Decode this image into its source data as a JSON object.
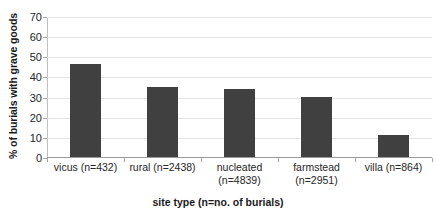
{
  "chart_data": {
    "type": "bar",
    "title": "",
    "categories": [
      "vicus (n=432)",
      "rural (n=2438)",
      "nucleated (n=4839)",
      "farmstead (n=2951)",
      "villa (n=864)"
    ],
    "category_lines": [
      [
        "vicus (n=432)"
      ],
      [
        "rural (n=2438)"
      ],
      [
        "nucleated",
        "(n=4839)"
      ],
      [
        "farmstead",
        "(n=2951)"
      ],
      [
        "villa (n=864)"
      ]
    ],
    "values": [
      46,
      35,
      34,
      30,
      11
    ],
    "xlabel": "site type (n=no. of burials)",
    "ylabel": "% of burials with grave goods",
    "ylim": [
      0,
      70
    ],
    "ytick_labels": [
      "70",
      "60",
      "50",
      "40",
      "30",
      "20",
      "10",
      "0"
    ],
    "ytick_values": [
      70,
      60,
      50,
      40,
      30,
      20,
      10,
      0
    ],
    "grid": "horizontal",
    "legend": "none",
    "bar_color": "#404040",
    "gridline_color": "#e4e4e4",
    "axis_color": "#9a9a9a"
  }
}
